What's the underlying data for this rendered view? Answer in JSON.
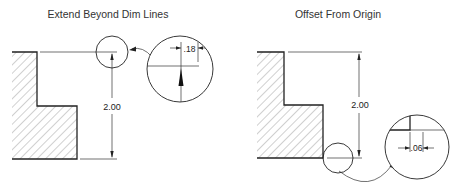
{
  "panels": [
    {
      "title": "Extend Beyond Dim Lines",
      "dimension": "2.00",
      "detail_dimension": ".18"
    },
    {
      "title": "Offset From Origin",
      "dimension": "2.00",
      "detail_dimension": ".06"
    }
  ],
  "colors": {
    "line": "#222222",
    "hatch": "#888888",
    "background": "#ffffff"
  }
}
